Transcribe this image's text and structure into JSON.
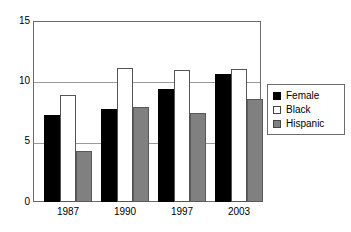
{
  "chart_data": {
    "type": "bar",
    "title": "",
    "subtitle": "",
    "xlabel": "",
    "ylabel": "",
    "categories": [
      "1987",
      "1990",
      "1997",
      "2003"
    ],
    "series": [
      {
        "name": "Female",
        "color": "#000000",
        "values": [
          7.2,
          7.7,
          9.4,
          10.6
        ]
      },
      {
        "name": "Black",
        "color": "#ffffff",
        "values": [
          8.85,
          11.1,
          10.95,
          11.0
        ]
      },
      {
        "name": "Hispanic",
        "color": "#808080",
        "values": [
          4.25,
          7.85,
          7.35,
          8.5
        ]
      }
    ],
    "ylim": [
      0,
      15
    ],
    "yticks": [
      0,
      5,
      10,
      15
    ],
    "ytick_labels": [
      "0",
      "5",
      "10",
      "15"
    ],
    "gridlines": [
      5,
      10
    ],
    "grid": true,
    "legend_position": "right",
    "legend_entries": [
      "Female",
      "Black",
      "Hispanic"
    ]
  },
  "legend": {
    "items": [
      {
        "label": "Female"
      },
      {
        "label": "Black"
      },
      {
        "label": "Hispanic"
      }
    ]
  },
  "axes": {
    "y_tick_labels": [
      "15",
      "10",
      "5",
      "0"
    ],
    "x_tick_labels": [
      "1987",
      "1990",
      "1997",
      "2003"
    ]
  }
}
